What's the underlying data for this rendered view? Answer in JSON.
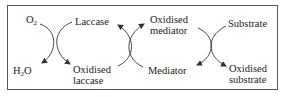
{
  "diagram": {
    "nodes": {
      "o2": {
        "text": "O",
        "sub": "2"
      },
      "h2o_h": "H",
      "h2o_sub": "2",
      "h2o_o": "O",
      "laccase": "Laccase",
      "oxidised_laccase_1": "Oxidised",
      "oxidised_laccase_2": "laccase",
      "oxidised_mediator_1": "Oxidised",
      "oxidised_mediator_2": "mediator",
      "mediator": "Mediator",
      "substrate": "Substrate",
      "oxidised_substrate_1": "Oxidised",
      "oxidised_substrate_2": "substrate"
    },
    "reactions": [
      {
        "from": [
          "O2",
          "Laccase"
        ],
        "to": [
          "H2O",
          "Oxidised laccase"
        ]
      },
      {
        "from": [
          "Oxidised laccase",
          "Mediator"
        ],
        "to": [
          "Laccase",
          "Oxidised mediator"
        ]
      },
      {
        "from": [
          "Oxidised mediator",
          "Substrate"
        ],
        "to": [
          "Mediator",
          "Oxidised substrate"
        ]
      }
    ],
    "colors": {
      "line": "#333333",
      "border": "#555555",
      "text": "#1a1a1a"
    }
  }
}
